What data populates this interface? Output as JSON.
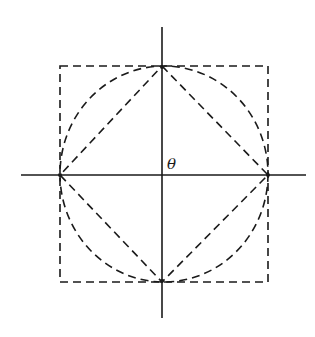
{
  "diagram": {
    "center_label": "θ",
    "colors": {
      "stroke": "#1a1a1a",
      "background": "#ffffff"
    },
    "elements": [
      {
        "type": "axis",
        "orientation": "vertical",
        "style": "solid"
      },
      {
        "type": "axis",
        "orientation": "horizontal",
        "style": "solid"
      },
      {
        "type": "square",
        "style": "dashed",
        "description": "circumscribed square"
      },
      {
        "type": "circle",
        "style": "dashed",
        "description": "inscribed circle"
      },
      {
        "type": "diamond",
        "style": "dashed",
        "description": "inscribed rotated square connecting axis intersections"
      }
    ]
  }
}
